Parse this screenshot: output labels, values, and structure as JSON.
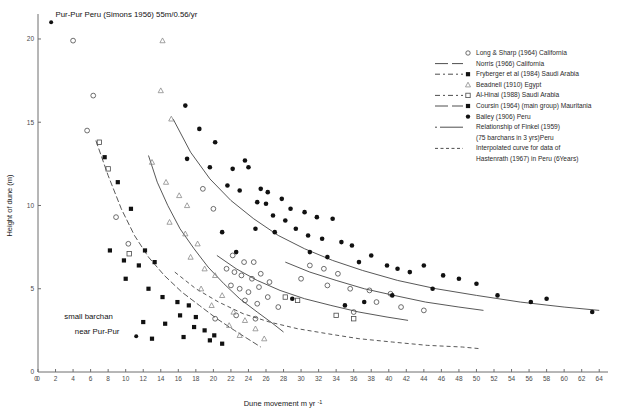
{
  "chart_data": {
    "type": "scatter",
    "title": "",
    "xlabel": "Dune movement m yr-1",
    "xlabel_base": "Dune movement m yr",
    "xlabel_exp": "-1",
    "ylabel": "Height of dune (m)",
    "xlim": [
      0,
      65
    ],
    "ylim": [
      0,
      21.5
    ],
    "xticks": [
      0,
      2,
      4,
      6,
      8,
      10,
      12,
      14,
      16,
      18,
      20,
      22,
      24,
      26,
      28,
      30,
      32,
      34,
      36,
      38,
      40,
      42,
      44,
      46,
      48,
      50,
      52,
      54,
      56,
      58,
      60,
      62,
      64
    ],
    "yticks": [
      5,
      10,
      15,
      20
    ],
    "grid": false,
    "legend_position": "right",
    "annotations": [
      {
        "name": "pur-pur-label",
        "text": "Pur-Pur Peru (Simons 1956) 55m/0.56/yr",
        "x": 2.0,
        "y": 21.3
      },
      {
        "name": "small-barchan-label-line1",
        "text": "small barchan",
        "x": 3.0,
        "y": 3.2
      },
      {
        "name": "small-barchan-label-line2",
        "text": "near Pur-Pur",
        "x": 4.2,
        "y": 2.3
      }
    ],
    "series": [
      {
        "name": "Long & Sharp (1964) California",
        "key": "long_sharp",
        "marker": "open-circle",
        "line": "none",
        "points": [
          [
            4.0,
            19.9
          ],
          [
            6.3,
            16.6
          ],
          [
            5.6,
            14.5
          ],
          [
            8.9,
            9.3
          ],
          [
            10.3,
            7.7
          ],
          [
            18.8,
            11.0
          ],
          [
            20.0,
            9.8
          ],
          [
            22.2,
            7.0
          ],
          [
            23.5,
            6.6
          ],
          [
            24.6,
            6.6
          ],
          [
            21.5,
            6.2
          ],
          [
            22.4,
            6.0
          ],
          [
            23.2,
            5.8
          ],
          [
            24.4,
            5.6
          ],
          [
            25.4,
            5.9
          ],
          [
            22.0,
            5.2
          ],
          [
            23.0,
            5.0
          ],
          [
            24.0,
            4.8
          ],
          [
            25.2,
            5.1
          ],
          [
            26.4,
            5.4
          ],
          [
            23.6,
            4.3
          ],
          [
            25.0,
            4.1
          ],
          [
            26.2,
            4.5
          ],
          [
            27.4,
            3.9
          ],
          [
            22.6,
            3.4
          ],
          [
            24.8,
            3.2
          ],
          [
            20.2,
            3.2
          ],
          [
            31.0,
            6.4
          ],
          [
            32.6,
            6.2
          ],
          [
            34.2,
            5.9
          ],
          [
            30.0,
            5.6
          ],
          [
            33.0,
            5.2
          ],
          [
            35.6,
            5.0
          ],
          [
            37.8,
            4.9
          ],
          [
            40.2,
            4.7
          ],
          [
            38.6,
            4.2
          ],
          [
            36.0,
            3.6
          ],
          [
            41.4,
            3.9
          ],
          [
            44.0,
            3.7
          ]
        ]
      },
      {
        "name": "Norris (1966) California",
        "key": "norris",
        "marker": "none",
        "line": "solid",
        "points": []
      },
      {
        "name": "Fryberger et al (1984) Saudi Arabia",
        "key": "fryberger",
        "marker": "filled-square",
        "line": "dash-dot",
        "points": [
          [
            7.6,
            12.9
          ],
          [
            9.1,
            11.4
          ],
          [
            10.6,
            9.8
          ],
          [
            8.2,
            7.3
          ],
          [
            9.8,
            6.7
          ],
          [
            11.5,
            6.4
          ],
          [
            12.2,
            7.3
          ],
          [
            13.3,
            6.6
          ],
          [
            10.0,
            5.6
          ],
          [
            12.6,
            5.0
          ],
          [
            14.2,
            4.5
          ],
          [
            15.9,
            4.2
          ],
          [
            17.2,
            4.0
          ],
          [
            16.2,
            3.4
          ],
          [
            18.0,
            3.3
          ],
          [
            14.5,
            2.9
          ],
          [
            12.0,
            3.0
          ],
          [
            17.8,
            2.7
          ],
          [
            19.0,
            2.5
          ],
          [
            20.1,
            2.2
          ],
          [
            16.6,
            2.1
          ],
          [
            13.0,
            2.0
          ],
          [
            19.6,
            1.9
          ],
          [
            21.0,
            1.7
          ]
        ]
      },
      {
        "name": "Beadnell (1910) Egypt",
        "key": "beadnell",
        "marker": "triangle",
        "line": "none",
        "points": [
          [
            14.2,
            19.9
          ],
          [
            14.0,
            16.9
          ],
          [
            15.2,
            15.2
          ],
          [
            13.0,
            12.6
          ],
          [
            14.6,
            11.4
          ],
          [
            16.1,
            10.6
          ],
          [
            17.0,
            10.0
          ],
          [
            15.0,
            9.0
          ],
          [
            16.8,
            8.3
          ],
          [
            18.2,
            7.7
          ],
          [
            17.4,
            6.9
          ],
          [
            19.0,
            6.2
          ],
          [
            20.2,
            5.8
          ],
          [
            18.6,
            5.0
          ],
          [
            21.0,
            4.6
          ],
          [
            19.8,
            4.0
          ],
          [
            22.3,
            3.6
          ],
          [
            23.6,
            3.1
          ],
          [
            21.8,
            2.8
          ],
          [
            24.8,
            2.6
          ],
          [
            23.0,
            2.2
          ],
          [
            25.8,
            2.0
          ]
        ]
      },
      {
        "name": "Al-Hinai (1988) Saudi Arabia",
        "key": "al_hinai",
        "marker": "open-square",
        "line": "dash-dot",
        "points": [
          [
            7.0,
            13.8
          ],
          [
            8.0,
            12.2
          ],
          [
            10.4,
            7.1
          ],
          [
            28.2,
            4.5
          ],
          [
            29.6,
            4.3
          ],
          [
            34.0,
            3.4
          ],
          [
            36.0,
            3.2
          ]
        ]
      },
      {
        "name": "Coursin (1964) (main group) Mauritania",
        "key": "coursin",
        "marker": "filled-square",
        "line": "solid",
        "points": []
      },
      {
        "name": "Bailey (1906) Peru",
        "key": "bailey",
        "marker": "filled-circle",
        "line": "none",
        "points": [
          [
            16.8,
            16.0
          ],
          [
            18.4,
            14.6
          ],
          [
            20.2,
            13.8
          ],
          [
            17.0,
            12.8
          ],
          [
            19.6,
            12.3
          ],
          [
            22.2,
            12.2
          ],
          [
            23.6,
            12.7
          ],
          [
            24.0,
            12.3
          ],
          [
            21.6,
            11.2
          ],
          [
            23.0,
            10.9
          ],
          [
            25.4,
            11.0
          ],
          [
            26.2,
            10.8
          ],
          [
            25.0,
            10.2
          ],
          [
            26.0,
            10.1
          ],
          [
            27.8,
            10.4
          ],
          [
            28.8,
            9.8
          ],
          [
            26.8,
            9.4
          ],
          [
            28.2,
            9.1
          ],
          [
            24.8,
            8.6
          ],
          [
            27.0,
            8.4
          ],
          [
            30.4,
            9.6
          ],
          [
            31.8,
            9.3
          ],
          [
            29.4,
            8.6
          ],
          [
            30.8,
            8.2
          ],
          [
            33.6,
            9.2
          ],
          [
            32.4,
            8.0
          ],
          [
            34.6,
            7.8
          ],
          [
            31.0,
            7.2
          ],
          [
            35.8,
            7.6
          ],
          [
            33.0,
            6.9
          ],
          [
            36.6,
            6.6
          ],
          [
            38.0,
            7.0
          ],
          [
            39.8,
            6.4
          ],
          [
            41.0,
            6.2
          ],
          [
            42.4,
            6.0
          ],
          [
            44.0,
            6.4
          ],
          [
            46.2,
            5.8
          ],
          [
            48.0,
            5.6
          ],
          [
            50.0,
            5.3
          ],
          [
            45.0,
            5.0
          ],
          [
            52.4,
            4.6
          ],
          [
            56.2,
            4.2
          ],
          [
            58.0,
            4.4
          ],
          [
            63.2,
            3.6
          ],
          [
            40.4,
            4.6
          ],
          [
            37.2,
            4.2
          ],
          [
            35.0,
            4.0
          ],
          [
            29.0,
            4.4
          ],
          [
            21.0,
            8.4
          ],
          [
            22.6,
            7.2
          ]
        ]
      }
    ],
    "curves": [
      {
        "name": "fryberger-curve",
        "style": "dash-dot",
        "path": [
          [
            6.6,
            13.9
          ],
          [
            8.0,
            11.8
          ],
          [
            9.5,
            9.8
          ],
          [
            11.0,
            8.2
          ],
          [
            12.6,
            6.9
          ],
          [
            14.4,
            5.8
          ],
          [
            16.4,
            4.8
          ],
          [
            18.4,
            4.0
          ],
          [
            20.4,
            3.2
          ],
          [
            22.4,
            2.5
          ],
          [
            24.2,
            1.9
          ],
          [
            25.4,
            1.5
          ]
        ]
      },
      {
        "name": "beadnell-curve",
        "style": "solid",
        "path": [
          [
            12.6,
            13.0
          ],
          [
            13.6,
            11.4
          ],
          [
            14.8,
            10.0
          ],
          [
            16.2,
            8.6
          ],
          [
            17.8,
            7.4
          ],
          [
            19.4,
            6.3
          ],
          [
            21.2,
            5.3
          ],
          [
            23.0,
            4.4
          ],
          [
            25.0,
            3.6
          ],
          [
            26.8,
            2.9
          ],
          [
            28.0,
            2.4
          ]
        ]
      },
      {
        "name": "bailey-curve",
        "style": "solid",
        "path": [
          [
            15.4,
            15.2
          ],
          [
            17.4,
            13.2
          ],
          [
            19.6,
            11.6
          ],
          [
            22.0,
            10.3
          ],
          [
            24.6,
            9.2
          ],
          [
            27.4,
            8.2
          ],
          [
            30.4,
            7.4
          ],
          [
            33.6,
            6.7
          ],
          [
            37.0,
            6.1
          ],
          [
            41.0,
            5.5
          ],
          [
            45.4,
            5.0
          ],
          [
            50.0,
            4.6
          ],
          [
            55.0,
            4.2
          ],
          [
            60.0,
            3.9
          ],
          [
            64.0,
            3.7
          ]
        ]
      },
      {
        "name": "coursin-curve",
        "style": "solid",
        "path": [
          [
            28.2,
            6.6
          ],
          [
            31.0,
            6.0
          ],
          [
            34.0,
            5.5
          ],
          [
            37.2,
            5.0
          ],
          [
            40.6,
            4.6
          ],
          [
            44.2,
            4.2
          ],
          [
            48.0,
            3.9
          ],
          [
            50.8,
            3.7
          ]
        ]
      },
      {
        "name": "finkel-curve",
        "style": "solid",
        "path": [
          [
            20.4,
            7.0
          ],
          [
            22.6,
            6.2
          ],
          [
            25.0,
            5.5
          ],
          [
            27.6,
            4.9
          ],
          [
            30.4,
            4.4
          ],
          [
            33.4,
            4.0
          ],
          [
            36.6,
            3.6
          ],
          [
            39.8,
            3.3
          ],
          [
            42.2,
            3.1
          ]
        ]
      },
      {
        "name": "hastenrath-curve",
        "style": "dashed",
        "path": [
          [
            15.6,
            6.0
          ],
          [
            18.0,
            5.0
          ],
          [
            20.6,
            4.2
          ],
          [
            23.4,
            3.5
          ],
          [
            26.4,
            3.0
          ],
          [
            29.6,
            2.6
          ],
          [
            33.0,
            2.3
          ],
          [
            36.6,
            2.0
          ],
          [
            40.4,
            1.8
          ],
          [
            44.4,
            1.6
          ],
          [
            48.4,
            1.5
          ],
          [
            50.4,
            1.4
          ]
        ]
      }
    ]
  },
  "legend": {
    "entries": [
      {
        "label": "Long &  Sharp (1964) California",
        "marker": "open-circle",
        "line": "none"
      },
      {
        "label": "Norris (1966) California",
        "marker": "none",
        "line": "solid"
      },
      {
        "label": "Fryberger et al (1984) Saudi Arabia",
        "marker": "filled-square",
        "line": "dash-dot"
      },
      {
        "label": "Beadnell (1910) Egypt",
        "marker": "triangle",
        "line": "none"
      },
      {
        "label": "Al-Hinai (1988) Saudi Arabia",
        "marker": "open-square",
        "line": "dash-dot"
      },
      {
        "label": "Coursin (1964) (main group) Mauritania",
        "marker": "filled-square",
        "line": "solid"
      },
      {
        "label": "Bailey (1906) Peru",
        "marker": "filled-circle",
        "line": "none"
      },
      {
        "label": "Relationship of Finkel (1959)",
        "marker": "none",
        "line": "solid-short",
        "continuation": false
      },
      {
        "label": "(75 barchans in 3 yrs)Peru",
        "marker": "none",
        "line": "none",
        "continuation": true
      },
      {
        "label": "Interpolated curve for data of",
        "marker": "none",
        "line": "dashed",
        "continuation": false
      },
      {
        "label": "Hastenrath (1967) in Peru (6Years)",
        "marker": "none",
        "line": "none",
        "continuation": true
      }
    ]
  }
}
